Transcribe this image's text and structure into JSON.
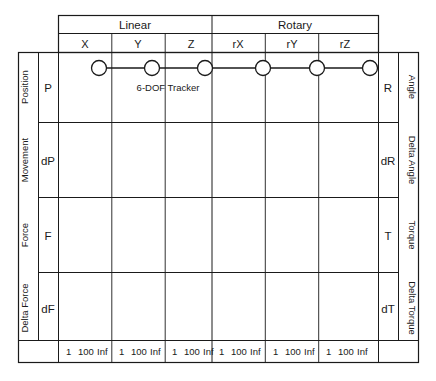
{
  "diagram": {
    "device_label": "6-DOF Tracker",
    "colors": {
      "line": "#1a1a1a",
      "text": "#1a1a1a",
      "node_fill": "#ffffff",
      "background": "#ffffff"
    },
    "column_groups": [
      {
        "label": "Linear",
        "columns": [
          "X",
          "Y",
          "Z"
        ]
      },
      {
        "label": "Rotary",
        "columns": [
          "rX",
          "rY",
          "rZ"
        ]
      }
    ],
    "columns": [
      {
        "key": "X",
        "label": "X",
        "group": "Linear"
      },
      {
        "key": "Y",
        "label": "Y",
        "group": "Linear"
      },
      {
        "key": "Z",
        "label": "Z",
        "group": "Linear"
      },
      {
        "key": "rX",
        "label": "rX",
        "group": "Rotary"
      },
      {
        "key": "rY",
        "label": "rY",
        "group": "Rotary"
      },
      {
        "key": "rZ",
        "label": "rZ",
        "group": "Rotary"
      }
    ],
    "rows": [
      {
        "left_category": "Position",
        "left_symbol": "P",
        "right_category": "Angle",
        "right_symbol": "R",
        "nodes": [
          "X",
          "Y",
          "Z",
          "rX",
          "rY",
          "rZ"
        ]
      },
      {
        "left_category": "Movement",
        "left_symbol": "dP",
        "right_category": "Delta Angle",
        "right_symbol": "dR",
        "nodes": []
      },
      {
        "left_category": "Force",
        "left_symbol": "F",
        "right_category": "Torque",
        "right_symbol": "T",
        "nodes": []
      },
      {
        "left_category": "Delta Force",
        "left_symbol": "dF",
        "right_category": "Delta Torque",
        "right_symbol": "dT",
        "nodes": []
      }
    ],
    "footer_scale": {
      "ticks": [
        "1",
        "100",
        "Inf"
      ],
      "per_column": [
        [
          "1",
          "100",
          "Inf"
        ],
        [
          "1",
          "100",
          "Inf"
        ],
        [
          "1",
          "100",
          "Inf"
        ],
        [
          "1",
          "100",
          "Inf"
        ],
        [
          "1",
          "100",
          "Inf"
        ],
        [
          "1",
          "100",
          "Inf"
        ]
      ]
    }
  }
}
